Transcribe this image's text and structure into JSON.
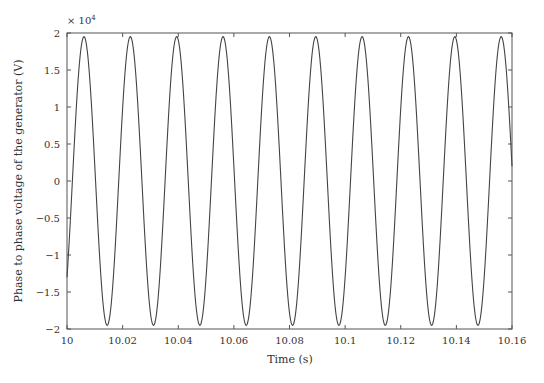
{
  "chart_data": {
    "type": "line",
    "title": "",
    "xlabel": "Time (s)",
    "ylabel": "Phase to phase voltage of the generator (V)",
    "y_multiplier_label": "× 10",
    "y_multiplier_exp": "4",
    "xlim": [
      10,
      10.16
    ],
    "ylim": [
      -2,
      2
    ],
    "xticks": [
      10,
      10.02,
      10.04,
      10.06,
      10.08,
      10.1,
      10.12,
      10.14,
      10.16
    ],
    "xtick_labels": [
      "10",
      "10.02",
      "10.04",
      "10.06",
      "10.08",
      "10.1",
      "10.12",
      "10.14",
      "10.16"
    ],
    "yticks": [
      -2,
      -1.5,
      -1,
      -0.5,
      0,
      0.5,
      1,
      1.5,
      2
    ],
    "ytick_labels": [
      "−2",
      "−1.5",
      "−1",
      "−0.5",
      "0",
      "0.5",
      "1",
      "1.5",
      "2"
    ],
    "grid": false,
    "legend": null,
    "series": [
      {
        "name": "Phase to phase voltage",
        "description": "Sinusoid, ~60 Hz, amplitude ~1.95e4 V, starts at ~-1.3e4 rising at t=10 s",
        "frequency_hz": 60,
        "amplitude": 1.95,
        "phase_rad": -0.73,
        "color": "#444444",
        "peak_times": [
          10.0061,
          10.0228,
          10.0394,
          10.0561,
          10.0728,
          10.0894,
          10.1061,
          10.1228,
          10.1394,
          10.1561
        ],
        "peak_values": [
          1.95,
          1.95,
          1.95,
          1.95,
          1.95,
          1.95,
          1.95,
          1.95,
          1.95,
          1.95
        ],
        "trough_times": [
          10.0144,
          10.0311,
          10.0478,
          10.0644,
          10.0811,
          10.0978,
          10.1144,
          10.1311,
          10.1478
        ],
        "trough_values": [
          -1.95,
          -1.95,
          -1.95,
          -1.95,
          -1.95,
          -1.95,
          -1.95,
          -1.95,
          -1.95
        ]
      }
    ]
  }
}
